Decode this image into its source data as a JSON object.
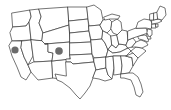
{
  "figure": {
    "kind": "map",
    "width": 171,
    "height": 110,
    "background_color": "#ffffff",
    "border_color": "#3a3a3a",
    "state_fill_color": "#ffffff",
    "marker_color": "#6b6b6b",
    "projection_note": "contiguous 48 states, Alaska and Hawaii not shown"
  },
  "markers": [
    {
      "label": "marker-west",
      "region": "Nevada",
      "x": 15,
      "y": 50,
      "radius": 3.6,
      "color": "#6b6b6b"
    },
    {
      "label": "marker-central",
      "region": "Colorado",
      "x": 59,
      "y": 51,
      "radius": 3.8,
      "color": "#6b6b6b"
    }
  ],
  "states": [
    {
      "code": "WA",
      "name": "Washington"
    },
    {
      "code": "OR",
      "name": "Oregon"
    },
    {
      "code": "CA",
      "name": "California"
    },
    {
      "code": "NV",
      "name": "Nevada"
    },
    {
      "code": "ID",
      "name": "Idaho"
    },
    {
      "code": "MT",
      "name": "Montana"
    },
    {
      "code": "WY",
      "name": "Wyoming"
    },
    {
      "code": "UT",
      "name": "Utah"
    },
    {
      "code": "AZ",
      "name": "Arizona"
    },
    {
      "code": "NM",
      "name": "New Mexico"
    },
    {
      "code": "CO",
      "name": "Colorado"
    },
    {
      "code": "ND",
      "name": "North Dakota"
    },
    {
      "code": "SD",
      "name": "South Dakota"
    },
    {
      "code": "NE",
      "name": "Nebraska"
    },
    {
      "code": "KS",
      "name": "Kansas"
    },
    {
      "code": "OK",
      "name": "Oklahoma"
    },
    {
      "code": "TX",
      "name": "Texas"
    },
    {
      "code": "MN",
      "name": "Minnesota"
    },
    {
      "code": "IA",
      "name": "Iowa"
    },
    {
      "code": "MO",
      "name": "Missouri"
    },
    {
      "code": "AR",
      "name": "Arkansas"
    },
    {
      "code": "LA",
      "name": "Louisiana"
    },
    {
      "code": "WI",
      "name": "Wisconsin"
    },
    {
      "code": "IL",
      "name": "Illinois"
    },
    {
      "code": "MS",
      "name": "Mississippi"
    },
    {
      "code": "MI",
      "name": "Michigan"
    },
    {
      "code": "IN",
      "name": "Indiana"
    },
    {
      "code": "KY",
      "name": "Kentucky"
    },
    {
      "code": "TN",
      "name": "Tennessee"
    },
    {
      "code": "AL",
      "name": "Alabama"
    },
    {
      "code": "OH",
      "name": "Ohio"
    },
    {
      "code": "WV",
      "name": "West Virginia"
    },
    {
      "code": "GA",
      "name": "Georgia"
    },
    {
      "code": "FL",
      "name": "Florida"
    },
    {
      "code": "SC",
      "name": "South Carolina"
    },
    {
      "code": "NC",
      "name": "North Carolina"
    },
    {
      "code": "VA",
      "name": "Virginia"
    },
    {
      "code": "MD",
      "name": "Maryland"
    },
    {
      "code": "DE",
      "name": "Delaware"
    },
    {
      "code": "PA",
      "name": "Pennsylvania"
    },
    {
      "code": "NJ",
      "name": "New Jersey"
    },
    {
      "code": "NY",
      "name": "New York"
    },
    {
      "code": "CT",
      "name": "Connecticut"
    },
    {
      "code": "RI",
      "name": "Rhode Island"
    },
    {
      "code": "MA",
      "name": "Massachusetts"
    },
    {
      "code": "VT",
      "name": "Vermont"
    },
    {
      "code": "NH",
      "name": "New Hampshire"
    },
    {
      "code": "ME",
      "name": "Maine"
    }
  ]
}
